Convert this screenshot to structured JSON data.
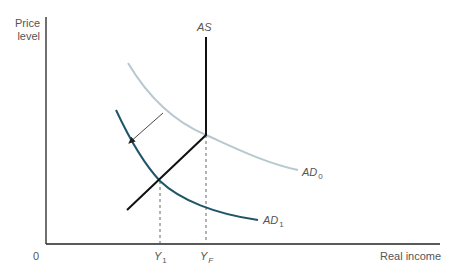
{
  "diagram": {
    "type": "AD-AS model",
    "axes": {
      "y_label_line1": "Price",
      "y_label_line2": "level",
      "x_label": "Real income",
      "origin": "0"
    },
    "curves": {
      "as": {
        "label": "AS",
        "color": "#111111"
      },
      "ad0": {
        "label": "AD",
        "subscript": "0",
        "color": "#b7c8ce"
      },
      "ad1": {
        "label": "AD",
        "subscript": "1",
        "color": "#1f5568"
      }
    },
    "x_ticks": {
      "y1": {
        "label": "Y",
        "subscript": "1"
      },
      "yf": {
        "label": "Y",
        "subscript": "F"
      }
    },
    "annotations": {
      "shift_arrow": "AD shifts left from AD0 to AD1"
    }
  }
}
